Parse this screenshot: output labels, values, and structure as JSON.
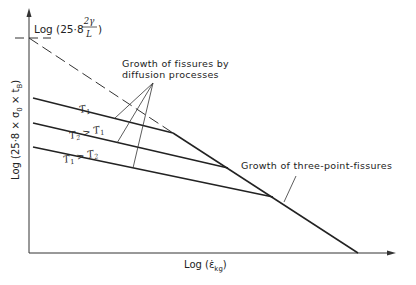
{
  "diagram": {
    "y_axis_label": "Log (25·8 × σ₀ × t_B)",
    "y_axis_label_parts": {
      "prefix": "Log (25·8 × σ",
      "sub1": "0",
      "mid": " × t",
      "sub2": "B",
      "suffix": ")"
    },
    "x_axis_label_parts": {
      "prefix": "Log (ε̇",
      "sub": "kg",
      "suffix": ")"
    },
    "x_axis_label": "Log (ε̇_kg)",
    "intercept_label_parts": {
      "prefix": "Log (25·8",
      "num": "2γ",
      "den": "L",
      "suffix": ")"
    },
    "intercept_label": "Log (25·8 · 2γ/L)",
    "annotation_diffusion": [
      "Growth of fissures by",
      "diffusion processes"
    ],
    "annotation_three_point": "Growth of three-point-fissures",
    "curves": [
      {
        "name": "T1",
        "label_main": "T",
        "label_sub": "1",
        "label_rest": ""
      },
      {
        "name": "T2 > T1",
        "label_main": "T",
        "label_sub": "2",
        "label_rest": " > T",
        "label_sub2": "1"
      },
      {
        "name": "T1 > T2",
        "label_main": "T",
        "label_sub": "1",
        "label_rest": " > T",
        "label_sub2": "2"
      }
    ]
  }
}
